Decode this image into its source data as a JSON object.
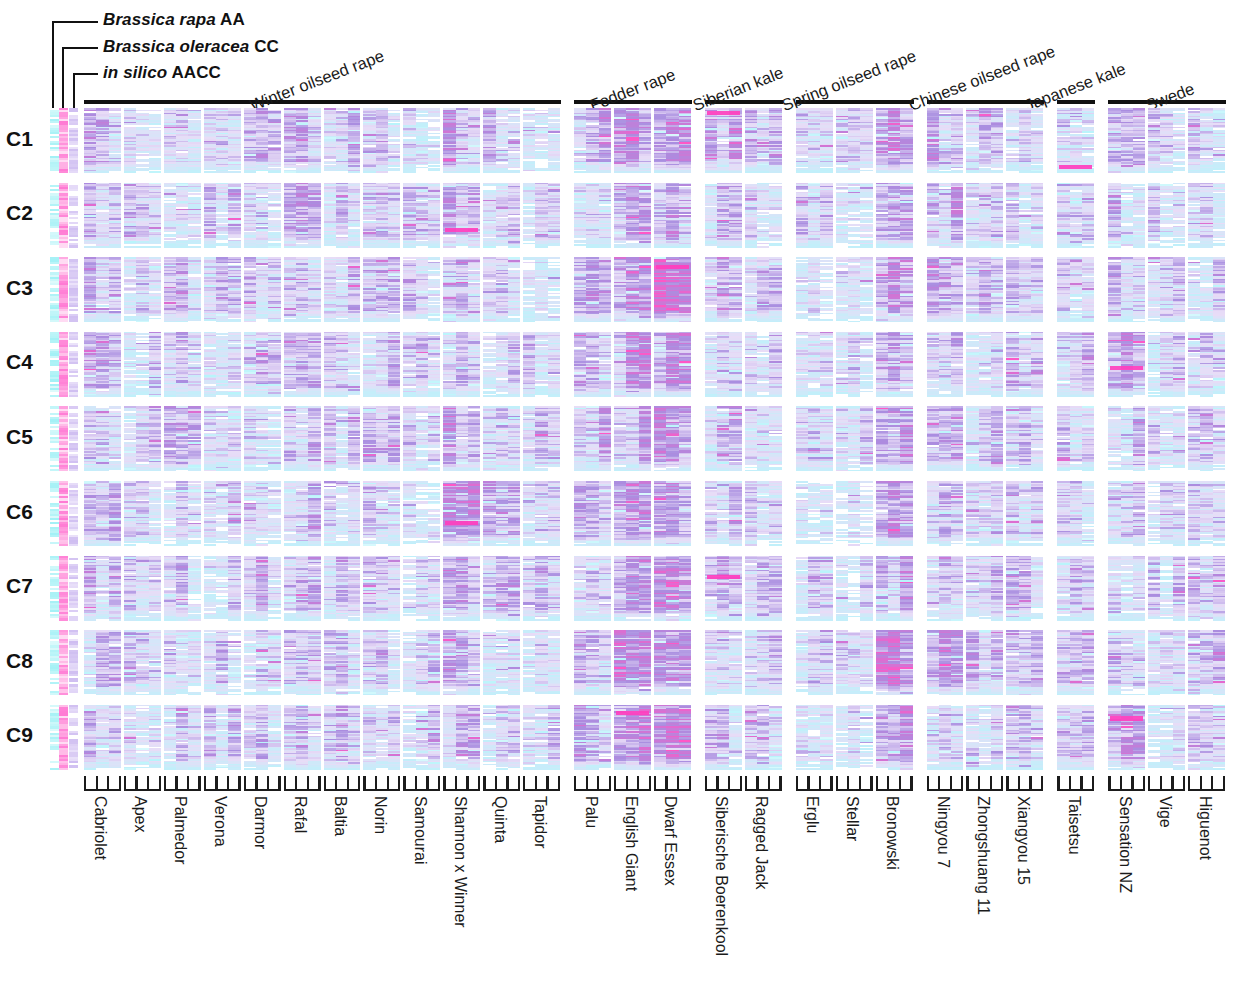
{
  "figure": {
    "type": "heatmap",
    "row_labels": [
      "C1",
      "C2",
      "C3",
      "C4",
      "C5",
      "C6",
      "C7",
      "C8",
      "C9"
    ],
    "reference_tracks": [
      {
        "id": "rapa",
        "label_species": "Brassica rapa",
        "label_genome": "AA",
        "color": "#9ef0f5"
      },
      {
        "id": "oleracea",
        "label_species": "Brassica oleracea",
        "label_genome": "CC",
        "color": "#ff6fd0"
      },
      {
        "id": "insilico",
        "label_species": "in silico",
        "label_genome": "AACC",
        "color": "#c9b6ef"
      }
    ],
    "groups": [
      {
        "name": "Winter oilseed rape",
        "start": 0,
        "count": 12
      },
      {
        "name": "Fodder rape",
        "start": 12,
        "count": 3
      },
      {
        "name": "Siberian kale",
        "start": 15,
        "count": 2
      },
      {
        "name": "Spring oilseed rape",
        "start": 17,
        "count": 3
      },
      {
        "name": "Chinese oilseed rape",
        "start": 20,
        "count": 3
      },
      {
        "name": "Japanese kale",
        "start": 23,
        "count": 1
      },
      {
        "name": "Swede",
        "start": 24,
        "count": 3
      }
    ],
    "cultivars": [
      "Cabriolet",
      "Apex",
      "Palmedor",
      "Verona",
      "Darmor",
      "Rafal",
      "Baltia",
      "Norin",
      "Samourai",
      "Shannon x Winner",
      "Quinta",
      "Tapidor",
      "Palu",
      "English Giant",
      "Dwarf Essex",
      "Siberische Boerenkool",
      "Ragged Jack",
      "Erglu",
      "Stellar",
      "Bronowski",
      "Ningyou 7",
      "Zhongshuang 11",
      "Xiangyou 15",
      "Taisetsu",
      "Sensation NZ",
      "Vige",
      "Higuenot"
    ],
    "palette": {
      "background": "#ffffff",
      "low": "#b8f4fb",
      "mid": "#d8c8ef",
      "high": "#8f78d6",
      "extreme": "#ff57c6",
      "axis": "#111111"
    },
    "subcolumns_per_cultivar": 3
  },
  "chart_data": {
    "type": "heatmap",
    "title": "",
    "xlabel": "",
    "ylabel": "",
    "grid": false,
    "legend": "none",
    "y_categories": [
      "C1",
      "C2",
      "C3",
      "C4",
      "C5",
      "C6",
      "C7",
      "C8",
      "C9"
    ],
    "x_categories": [
      "Cabriolet",
      "Apex",
      "Palmedor",
      "Verona",
      "Darmor",
      "Rafal",
      "Baltia",
      "Norin",
      "Samourai",
      "Shannon x Winner",
      "Quinta",
      "Tapidor",
      "Palu",
      "English Giant",
      "Dwarf Essex",
      "Siberische Boerenkool",
      "Ragged Jack",
      "Erglu",
      "Stellar",
      "Bronowski",
      "Ningyou 7",
      "Zhongshuang 11",
      "Xiangyou 15",
      "Taisetsu",
      "Sensation NZ",
      "Vige",
      "Higuenot"
    ],
    "intensity_by_row_and_cultivar": [
      [
        0.42,
        0.3,
        0.33,
        0.31,
        0.36,
        0.4,
        0.38,
        0.34,
        0.3,
        0.44,
        0.36,
        0.31,
        0.46,
        0.52,
        0.58,
        0.4,
        0.33,
        0.32,
        0.3,
        0.55,
        0.45,
        0.38,
        0.36,
        0.34,
        0.36,
        0.28,
        0.35
      ],
      [
        0.36,
        0.29,
        0.31,
        0.3,
        0.34,
        0.42,
        0.35,
        0.33,
        0.29,
        0.46,
        0.33,
        0.3,
        0.4,
        0.48,
        0.5,
        0.34,
        0.31,
        0.3,
        0.28,
        0.52,
        0.42,
        0.36,
        0.34,
        0.31,
        0.33,
        0.27,
        0.33
      ],
      [
        0.38,
        0.31,
        0.33,
        0.31,
        0.35,
        0.41,
        0.36,
        0.34,
        0.3,
        0.42,
        0.34,
        0.31,
        0.44,
        0.55,
        0.78,
        0.38,
        0.34,
        0.31,
        0.29,
        0.5,
        0.43,
        0.37,
        0.35,
        0.32,
        0.35,
        0.28,
        0.34
      ],
      [
        0.37,
        0.3,
        0.32,
        0.3,
        0.34,
        0.39,
        0.35,
        0.33,
        0.29,
        0.41,
        0.33,
        0.3,
        0.42,
        0.5,
        0.52,
        0.36,
        0.32,
        0.3,
        0.28,
        0.49,
        0.41,
        0.35,
        0.33,
        0.31,
        0.52,
        0.27,
        0.33
      ],
      [
        0.39,
        0.31,
        0.33,
        0.31,
        0.35,
        0.4,
        0.36,
        0.34,
        0.3,
        0.43,
        0.34,
        0.31,
        0.43,
        0.51,
        0.53,
        0.37,
        0.33,
        0.31,
        0.29,
        0.51,
        0.42,
        0.36,
        0.34,
        0.32,
        0.34,
        0.28,
        0.34
      ],
      [
        0.38,
        0.3,
        0.32,
        0.3,
        0.34,
        0.39,
        0.35,
        0.33,
        0.29,
        0.6,
        0.33,
        0.3,
        0.42,
        0.5,
        0.54,
        0.36,
        0.32,
        0.3,
        0.28,
        0.5,
        0.41,
        0.35,
        0.33,
        0.31,
        0.34,
        0.27,
        0.33
      ],
      [
        0.37,
        0.3,
        0.32,
        0.3,
        0.34,
        0.38,
        0.35,
        0.33,
        0.29,
        0.4,
        0.33,
        0.3,
        0.41,
        0.49,
        0.51,
        0.48,
        0.4,
        0.3,
        0.28,
        0.48,
        0.4,
        0.35,
        0.33,
        0.31,
        0.33,
        0.27,
        0.33
      ],
      [
        0.4,
        0.32,
        0.34,
        0.32,
        0.36,
        0.41,
        0.37,
        0.35,
        0.31,
        0.44,
        0.35,
        0.32,
        0.44,
        0.52,
        0.54,
        0.38,
        0.34,
        0.32,
        0.3,
        0.58,
        0.46,
        0.39,
        0.36,
        0.33,
        0.35,
        0.29,
        0.35
      ],
      [
        0.36,
        0.29,
        0.31,
        0.29,
        0.33,
        0.38,
        0.34,
        0.32,
        0.28,
        0.4,
        0.32,
        0.29,
        0.44,
        0.54,
        0.56,
        0.35,
        0.31,
        0.29,
        0.27,
        0.47,
        0.4,
        0.34,
        0.32,
        0.3,
        0.48,
        0.26,
        0.32
      ]
    ],
    "colorscale": [
      {
        "stop": 0.0,
        "color": "#b8f4fb"
      },
      {
        "stop": 0.35,
        "color": "#e8dcf7"
      },
      {
        "stop": 0.6,
        "color": "#a98ee0"
      },
      {
        "stop": 1.0,
        "color": "#ff57c6"
      }
    ]
  }
}
